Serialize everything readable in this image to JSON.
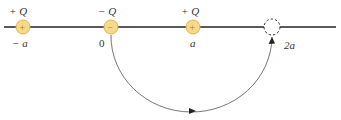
{
  "diagram": {
    "axis_color": "#222222",
    "charge_fill": "#f6d98a",
    "charge_stroke": "#e0b040",
    "path_color": "#555555",
    "charges": [
      {
        "sign": "+",
        "label": "+ Q",
        "position_label": "− a",
        "x": 23
      },
      {
        "sign": "−",
        "label": "− Q",
        "position_label": "0",
        "x": 111
      },
      {
        "sign": "+",
        "label": "+ Q",
        "position_label": "a",
        "x": 193
      }
    ],
    "destination": {
      "position_label": "2a",
      "x": 272,
      "style": "dashed"
    },
    "path": {
      "from": "0",
      "to": "2a",
      "shape": "semicircle-below"
    }
  }
}
